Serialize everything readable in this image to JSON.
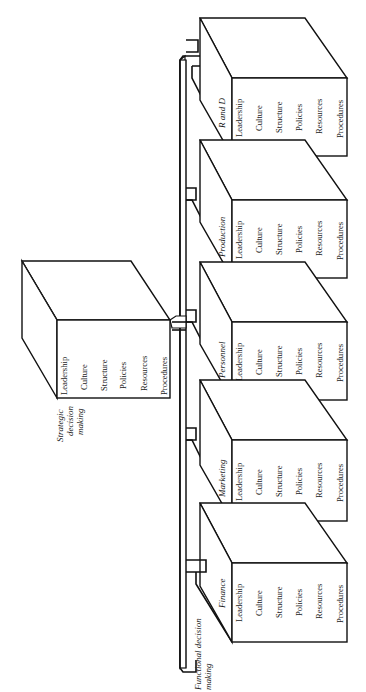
{
  "diagram": {
    "orientation": "rotated 90 degrees counter-clockwise",
    "strategic": {
      "title_lines": [
        "Strategic",
        "decision",
        "making"
      ],
      "items": [
        "Leadership",
        "Culture",
        "Structure",
        "Policies",
        "Resources",
        "Procedures"
      ]
    },
    "functional": {
      "title_lines": [
        "Functional decision",
        "making"
      ],
      "units": [
        {
          "name": "R and D",
          "items": [
            "Leadership",
            "Culture",
            "Structure",
            "Policies",
            "Resources",
            "Procedures"
          ]
        },
        {
          "name": "Production",
          "items": [
            "Leadership",
            "Culture",
            "Structure",
            "Policies",
            "Resources",
            "Procedures"
          ]
        },
        {
          "name": "Personnel",
          "items": [
            "Leadership",
            "Culture",
            "Structure",
            "Policies",
            "Resources",
            "Procedures"
          ]
        },
        {
          "name": "Marketing",
          "items": [
            "Leadership",
            "Culture",
            "Structure",
            "Policies",
            "Resources",
            "Procedures"
          ]
        },
        {
          "name": "Finance",
          "items": [
            "Leadership",
            "Culture",
            "Structure",
            "Policies",
            "Resources",
            "Procedures"
          ]
        }
      ]
    },
    "colors": {
      "line": "#111111",
      "background": "#ffffff",
      "text": "#1a1a1a"
    }
  }
}
